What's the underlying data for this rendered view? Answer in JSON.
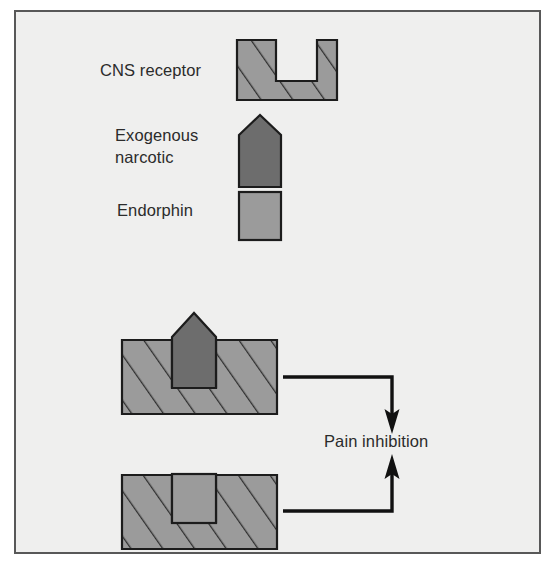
{
  "figure": {
    "background_color": "#efefee",
    "page_color": "#ffffff",
    "border_color": "#585858",
    "frame": {
      "x": 15,
      "y": 11,
      "width": 525,
      "height": 542
    }
  },
  "palette": {
    "receptor_fill": "#9b9b9b",
    "receptor_hatch": "#2f2f2f",
    "receptor_outline": "#1c1c1c",
    "narcotic_fill": "#6d6d6d",
    "narcotic_outline": "#1c1c1c",
    "endorphin_fill": "#9b9b9b",
    "endorphin_outline": "#1c1c1c",
    "arrow_color": "#111111",
    "text_color": "#2b2b2b"
  },
  "legend": {
    "items": [
      {
        "key": "cns-receptor",
        "label": "CNS receptor",
        "label_lines": [
          "CNS receptor"
        ],
        "shape": "notched-block-hatched",
        "label_x": 100,
        "label_y": 76,
        "swatch": {
          "x": 237,
          "y": 40,
          "width": 100,
          "height": 60
        }
      },
      {
        "key": "exogenous-narcotic",
        "label": "Exogenous narcotic",
        "label_lines": [
          "Exogenous",
          "narcotic"
        ],
        "shape": "pentagon-solid-dark",
        "label_x": 115,
        "label_y": 141,
        "label_line_height": 22,
        "swatch": {
          "x": 239,
          "y": 115,
          "width": 42,
          "height": 72
        }
      },
      {
        "key": "endorphin",
        "label": "Endorphin",
        "label_lines": [
          "Endorphin"
        ],
        "shape": "square-solid",
        "label_x": 117,
        "label_y": 216,
        "swatch": {
          "x": 239,
          "y": 192,
          "width": 42,
          "height": 48
        }
      }
    ]
  },
  "bound_states": [
    {
      "key": "narcotic-bound-receptor",
      "description": "Exogenous narcotic bound into CNS receptor notch",
      "ligand": "exogenous-narcotic",
      "receptor": {
        "x": 122,
        "y": 340,
        "width": 155,
        "height": 74
      },
      "notch": {
        "x": 172,
        "y": 340,
        "width": 44,
        "height": 47
      }
    },
    {
      "key": "endorphin-bound-receptor",
      "description": "Endorphin bound into CNS receptor notch",
      "ligand": "endorphin",
      "receptor": {
        "x": 122,
        "y": 475,
        "width": 155,
        "height": 74
      },
      "notch": {
        "x": 172,
        "y": 475,
        "width": 44,
        "height": 47
      }
    }
  ],
  "flow": {
    "outcome_label": "Pain inhibition",
    "outcome_label_x": 324,
    "outcome_label_y": 447,
    "arrows": [
      {
        "key": "narcotic-to-pain-inhibition",
        "from": "narcotic-bound-receptor",
        "to": "pain-inhibition",
        "direction": "down",
        "path": "M 283 377 L 392 377 L 392 420",
        "head": "down"
      },
      {
        "key": "endorphin-to-pain-inhibition",
        "from": "endorphin-bound-receptor",
        "to": "pain-inhibition",
        "direction": "up",
        "path": "M 283 511 L 392 511 L 392 468",
        "head": "up"
      }
    ]
  }
}
